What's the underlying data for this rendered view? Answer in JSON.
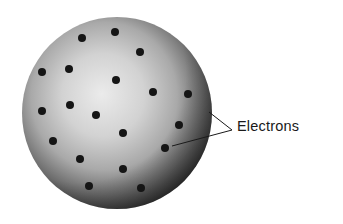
{
  "diagram": {
    "sphere": {
      "cx": 117,
      "cy": 113,
      "rx": 95,
      "ry": 96,
      "highlight_color": "#e6e6e6",
      "mid_color": "#b5b5b5",
      "edge_color": "#303030"
    },
    "electron_color": "#151515",
    "electron_radius": 4,
    "electrons": [
      {
        "x": 82,
        "y": 38
      },
      {
        "x": 115,
        "y": 32
      },
      {
        "x": 140,
        "y": 52
      },
      {
        "x": 42,
        "y": 72
      },
      {
        "x": 69,
        "y": 69
      },
      {
        "x": 116,
        "y": 80
      },
      {
        "x": 153,
        "y": 92
      },
      {
        "x": 188,
        "y": 94
      },
      {
        "x": 42,
        "y": 111
      },
      {
        "x": 70,
        "y": 105
      },
      {
        "x": 96,
        "y": 115
      },
      {
        "x": 179,
        "y": 125
      },
      {
        "x": 123,
        "y": 133
      },
      {
        "x": 53,
        "y": 141
      },
      {
        "x": 165,
        "y": 148
      },
      {
        "x": 80,
        "y": 159
      },
      {
        "x": 123,
        "y": 169
      },
      {
        "x": 89,
        "y": 186
      },
      {
        "x": 141,
        "y": 188
      }
    ],
    "label": {
      "text": "Electrons",
      "apex": {
        "x": 232,
        "y": 130
      },
      "leaders": [
        {
          "x1": 209,
          "y1": 112,
          "x2": 232,
          "y2": 130
        },
        {
          "x1": 232,
          "y1": 130,
          "x2": 172,
          "y2": 146
        }
      ]
    }
  }
}
